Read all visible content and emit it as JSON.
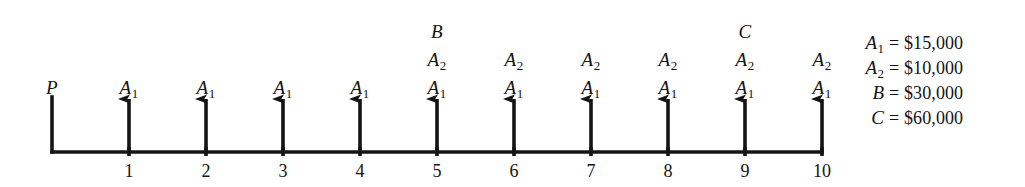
{
  "figure": {
    "type": "cash-flow-diagram",
    "background_color": "#ffffff",
    "ink_color": "#141414"
  },
  "timeline": {
    "label": "time-axis",
    "baseline_y": 152,
    "origin_x": 52,
    "period_spacing": 77,
    "start_period": 0,
    "end_period": 10,
    "tick_numbers": [
      "1",
      "2",
      "3",
      "4",
      "5",
      "6",
      "7",
      "8",
      "9",
      "10"
    ]
  },
  "present_flow": {
    "symbol": "P",
    "period": 0,
    "direction": "down",
    "has_arrowhead": false
  },
  "cash_flows": [
    {
      "period": 1,
      "direction": "up",
      "labels": [
        "A1"
      ]
    },
    {
      "period": 2,
      "direction": "up",
      "labels": [
        "A1"
      ]
    },
    {
      "period": 3,
      "direction": "up",
      "labels": [
        "A1"
      ]
    },
    {
      "period": 4,
      "direction": "up",
      "labels": [
        "A1"
      ]
    },
    {
      "period": 5,
      "direction": "up",
      "labels": [
        "A1",
        "A2",
        "B"
      ]
    },
    {
      "period": 6,
      "direction": "up",
      "labels": [
        "A1",
        "A2"
      ]
    },
    {
      "period": 7,
      "direction": "up",
      "labels": [
        "A1",
        "A2"
      ]
    },
    {
      "period": 8,
      "direction": "up",
      "labels": [
        "A1",
        "A2"
      ]
    },
    {
      "period": 9,
      "direction": "up",
      "labels": [
        "A1",
        "A2",
        "C"
      ]
    },
    {
      "period": 10,
      "direction": "up",
      "labels": [
        "A1",
        "A2"
      ]
    }
  ],
  "label_rows": {
    "row_bottom_y": 78,
    "row_middle_y": 50,
    "row_top_y": 22
  },
  "legend": {
    "name": "value-legend",
    "rows": [
      {
        "symbol": "A",
        "subscript": "1",
        "equals": "=",
        "value": "$15,000"
      },
      {
        "symbol": "A",
        "subscript": "2",
        "equals": "=",
        "value": "$10,000"
      },
      {
        "symbol": "B",
        "subscript": "",
        "equals": "=",
        "value": "$30,000"
      },
      {
        "symbol": "C",
        "subscript": "",
        "equals": "=",
        "value": "$60,000"
      }
    ]
  }
}
